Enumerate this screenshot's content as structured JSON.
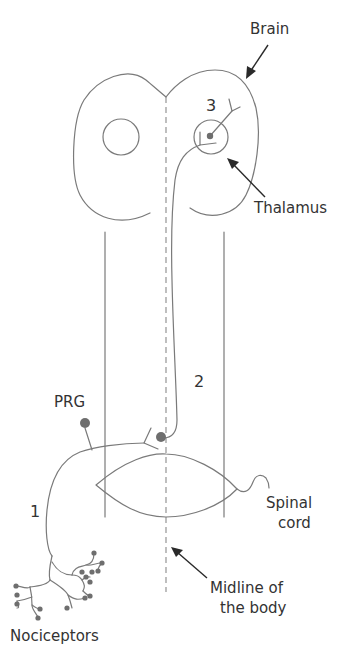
{
  "diagram": {
    "type": "pain-pathway",
    "labels": {
      "brain": "Brain",
      "thalamus": "Thalamus",
      "prg": "PRG",
      "spinal_cord_line1": "Spinal",
      "spinal_cord_line2": "cord",
      "midline_line1": "Midline of",
      "midline_line2": "the body",
      "nociceptors": "Nociceptors",
      "neuron_1": "1",
      "neuron_2": "2",
      "neuron_3": "3"
    },
    "colors": {
      "line": "#7a7a7a",
      "dot": "#6e6e6e",
      "arrow": "#2a2a2a",
      "text": "#333333",
      "background": "#ffffff"
    }
  }
}
